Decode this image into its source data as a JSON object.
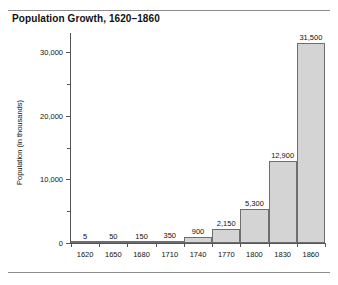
{
  "chart_data": {
    "type": "bar",
    "title": "Population Growth, 1620–1860",
    "xlabel": "",
    "ylabel": "Population (in thousands)",
    "categories": [
      "1620",
      "1650",
      "1680",
      "1710",
      "1740",
      "1770",
      "1800",
      "1830",
      "1860"
    ],
    "values": [
      5,
      50,
      150,
      350,
      900,
      2150,
      5300,
      12900,
      31500
    ],
    "value_labels": [
      "5",
      "50",
      "150",
      "350",
      "900",
      "2,150",
      "5,300",
      "12,900",
      "31,500"
    ],
    "ylim": [
      0,
      33000
    ],
    "y_major_ticks": [
      0,
      10000,
      20000,
      30000
    ],
    "y_major_tick_labels": [
      "0",
      "10,000",
      "20,000",
      "30,000"
    ],
    "y_minor_ticks": [
      5000,
      15000,
      25000
    ],
    "grid": false,
    "legend": "none",
    "bar_fill_color": "#d4d4d4",
    "bar_border_color": "#6e6e6e",
    "axis_color": "#555555",
    "text_color": "#111111",
    "background_color": "#ffffff"
  }
}
